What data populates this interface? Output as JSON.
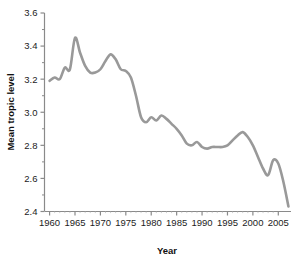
{
  "chart_data": {
    "type": "line",
    "title": "",
    "subtitle": "",
    "xlabel": "Year",
    "ylabel": "Mean tropic level",
    "xlim": [
      1959,
      2007.5
    ],
    "ylim": [
      2.4,
      3.6
    ],
    "grid": false,
    "legend": false,
    "legend_position": "none",
    "line_color": "#999999",
    "axis_color": "#808080",
    "text_color": "#1c1c1c",
    "x_ticks": [
      1960,
      1965,
      1970,
      1975,
      1980,
      1985,
      1990,
      1995,
      2000,
      2005
    ],
    "x_tick_labels": [
      "1960",
      "1965",
      "1970",
      "1975",
      "1980",
      "1985",
      "1990",
      "1995",
      "2000",
      "2005"
    ],
    "x_minor_tick_interval": 1,
    "y_ticks": [
      2.4,
      2.6,
      2.8,
      3.0,
      3.2,
      3.4,
      3.6
    ],
    "y_tick_labels": [
      "2.4",
      "2.6",
      "2.8",
      "3.0",
      "3.2",
      "3.4",
      "3.6"
    ],
    "y_minor_ticks": [
      2.5,
      2.7,
      2.9,
      3.1,
      3.3,
      3.5
    ],
    "series": [
      {
        "name": "Mean tropic level",
        "x": [
          1960,
          1961,
          1962,
          1963,
          1964,
          1965,
          1966,
          1967,
          1968,
          1969,
          1970,
          1971,
          1972,
          1973,
          1974,
          1975,
          1976,
          1977,
          1978,
          1979,
          1980,
          1981,
          1982,
          1983,
          1984,
          1985,
          1986,
          1987,
          1988,
          1989,
          1990,
          1991,
          1992,
          1993,
          1994,
          1995,
          1996,
          1997,
          1998,
          1999,
          2000,
          2001,
          2002,
          2003,
          2004,
          2005,
          2006,
          2007
        ],
        "values": [
          3.19,
          3.21,
          3.2,
          3.27,
          3.26,
          3.45,
          3.36,
          3.28,
          3.24,
          3.24,
          3.26,
          3.31,
          3.35,
          3.32,
          3.26,
          3.25,
          3.21,
          3.1,
          2.97,
          2.94,
          2.97,
          2.95,
          2.98,
          2.96,
          2.93,
          2.9,
          2.86,
          2.81,
          2.8,
          2.82,
          2.79,
          2.78,
          2.79,
          2.79,
          2.79,
          2.8,
          2.83,
          2.86,
          2.88,
          2.85,
          2.8,
          2.73,
          2.66,
          2.62,
          2.71,
          2.69,
          2.58,
          2.43
        ]
      }
    ],
    "annotations": []
  }
}
